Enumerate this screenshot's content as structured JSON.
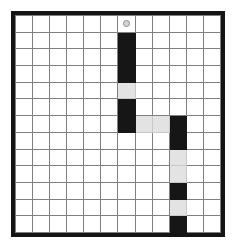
{
  "puzzle": {
    "title": "Grid Path Puzzle",
    "columns": 12,
    "rows": 13,
    "colors": {
      "background": "#ffffff",
      "border": "#141414",
      "gridline": "#808080",
      "path_black": "#161616",
      "path_gray": "#e3e3e3",
      "marker_fill": "#d6d6d6",
      "marker_stroke": "#8c8c8c"
    },
    "marker": {
      "name": "start-marker",
      "shape": "circle",
      "column": 6,
      "row": 0
    },
    "legend": {
      "black_label": "black",
      "gray_label": "gray",
      "white_label": "white"
    },
    "cells": [
      [
        "white",
        "white",
        "white",
        "white",
        "white",
        "white",
        "white",
        "white",
        "white",
        "white",
        "white",
        "white"
      ],
      [
        "white",
        "white",
        "white",
        "white",
        "white",
        "white",
        "black",
        "white",
        "white",
        "white",
        "white",
        "white"
      ],
      [
        "white",
        "white",
        "white",
        "white",
        "white",
        "white",
        "black",
        "white",
        "white",
        "white",
        "white",
        "white"
      ],
      [
        "white",
        "white",
        "white",
        "white",
        "white",
        "white",
        "black",
        "white",
        "white",
        "white",
        "white",
        "white"
      ],
      [
        "white",
        "white",
        "white",
        "white",
        "white",
        "white",
        "gray",
        "white",
        "white",
        "white",
        "white",
        "white"
      ],
      [
        "white",
        "white",
        "white",
        "white",
        "white",
        "white",
        "black",
        "white",
        "white",
        "white",
        "white",
        "white"
      ],
      [
        "white",
        "white",
        "white",
        "white",
        "white",
        "white",
        "black",
        "gray",
        "gray",
        "black",
        "white",
        "white"
      ],
      [
        "white",
        "white",
        "white",
        "white",
        "white",
        "white",
        "white",
        "white",
        "white",
        "black",
        "white",
        "white"
      ],
      [
        "white",
        "white",
        "white",
        "white",
        "white",
        "white",
        "white",
        "white",
        "white",
        "gray",
        "white",
        "white"
      ],
      [
        "white",
        "white",
        "white",
        "white",
        "white",
        "white",
        "white",
        "white",
        "white",
        "gray",
        "white",
        "white"
      ],
      [
        "white",
        "white",
        "white",
        "white",
        "white",
        "white",
        "white",
        "white",
        "white",
        "black",
        "white",
        "white"
      ],
      [
        "white",
        "white",
        "white",
        "white",
        "white",
        "white",
        "white",
        "white",
        "white",
        "gray",
        "white",
        "white"
      ],
      [
        "white",
        "white",
        "white",
        "white",
        "white",
        "white",
        "white",
        "white",
        "white",
        "black",
        "white",
        "white"
      ]
    ]
  }
}
